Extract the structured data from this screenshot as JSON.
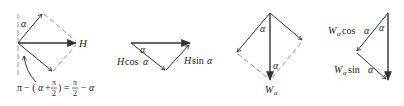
{
  "figure": {
    "panel1": {
      "alpha_label": "α",
      "H_label": "H",
      "equation": {
        "pi1": "π",
        "minus_open": "− (",
        "alpha": "α",
        "plus": "+",
        "frac1_num": "π",
        "frac1_den": "2",
        "close_eq": ") =",
        "frac2_num": "π",
        "frac2_den": "2",
        "minus2": "−",
        "alpha2": "α"
      }
    },
    "panel2": {
      "alpha_label": "α",
      "cos_H": "H",
      "cos_text": "cos ",
      "cos_alpha": "α",
      "sin_H": "H",
      "sin_text": "sin ",
      "sin_alpha": "α"
    },
    "panel3": {
      "alpha_label_top": "α",
      "alpha_label_bottom": "α",
      "W_label": "W",
      "W_sub": "α"
    },
    "panel4": {
      "alpha_label": "α",
      "cos_W": "W",
      "cos_sub": "α",
      "cos_text": " cos ",
      "cos_alpha": "α",
      "sin_W": "W",
      "sin_sub": "α",
      "sin_text": " sin ",
      "sin_alpha": "α"
    }
  }
}
